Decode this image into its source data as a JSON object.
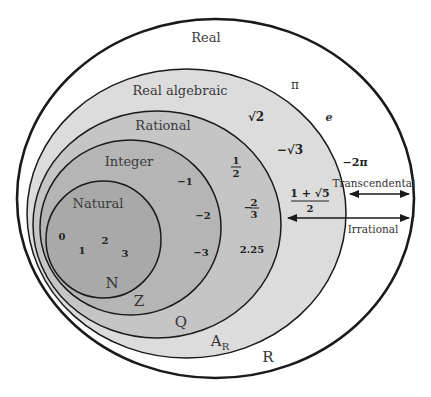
{
  "diagram": {
    "colors": {
      "real": "#ffffff",
      "real_algebraic": "#dcdcdc",
      "rational": "#c5c5c5",
      "integer": "#b5b5b5",
      "natural": "#a9a9a9",
      "stroke": "#1a1a1a"
    },
    "sets": {
      "real": {
        "name": "Real",
        "symbol": "R"
      },
      "real_algebraic": {
        "name": "Real algebraic",
        "symbol": "A",
        "symbol_sub": "R"
      },
      "rational": {
        "name": "Rational",
        "symbol": "Q"
      },
      "integer": {
        "name": "Integer",
        "symbol": "Z"
      },
      "natural": {
        "name": "Natural",
        "symbol": "N"
      }
    },
    "members": {
      "natural": [
        "0",
        "1",
        "2",
        "3"
      ],
      "integer": [
        "−1",
        "−2",
        "−3"
      ],
      "rational": {
        "half_num": "1",
        "half_den": "2",
        "neg_two_thirds_sign": "−",
        "neg_two_thirds_num": "2",
        "neg_two_thirds_den": "3",
        "decimal": "2.25"
      },
      "real_algebraic": {
        "sqrt2": "√2",
        "neg_sqrt3": "−√3",
        "golden_num": "1 + √5",
        "golden_den": "2"
      },
      "real": [
        "π",
        "e",
        "−2π"
      ]
    },
    "annotations": {
      "transcendental": "Transcendental",
      "irrational": "Irrational"
    }
  }
}
